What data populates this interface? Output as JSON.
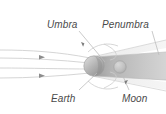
{
  "figure": {
    "background_color": "#ffffff",
    "width": 166,
    "height": 114
  },
  "labels": {
    "umbra": "Umbra",
    "penumbra": "Penumbra",
    "earth": "Earth",
    "moon": "Moon"
  },
  "colors": {
    "label_text": "#4a4a4a",
    "umbra_shadow": "#b8b8b8",
    "penumbra_shadow": "#dcdcdc",
    "earth_body": "#b0b0b0",
    "moon_body": "#c4c4c4",
    "ray_line": "#cfcfcf",
    "leader_line": "#bdbdbd",
    "arrow_marker": "#8a8a8a"
  },
  "elements": {
    "sunlight_rays": {
      "name": "sunlight-rays",
      "count": 4,
      "direction": "left-to-right",
      "arrow_marker_count": 2
    },
    "earth": {
      "name": "earth-sphere",
      "cx": 95,
      "cy": 66,
      "r": 10
    },
    "moon": {
      "name": "moon-sphere",
      "cx": 120,
      "cy": 67,
      "r": 6
    },
    "umbra_cone": {
      "name": "umbra-shadow-cone",
      "description": "dark central shadow extending right from Earth"
    },
    "penumbra_cone": {
      "name": "penumbra-shadow-region",
      "description": "lighter partial shadow bounding the umbra"
    }
  },
  "leaders": {
    "umbra": {
      "from_x": 78,
      "from_y": 30,
      "to_x": 104,
      "to_y": 60
    },
    "penumbra": {
      "from_x": 152,
      "from_y": 30,
      "to_x": 158,
      "to_y": 56
    },
    "earth": {
      "from_x": 78,
      "from_y": 92,
      "to_x": 96,
      "to_y": 74
    },
    "moon": {
      "from_x": 128,
      "from_y": 92,
      "to_x": 121,
      "to_y": 74
    }
  }
}
